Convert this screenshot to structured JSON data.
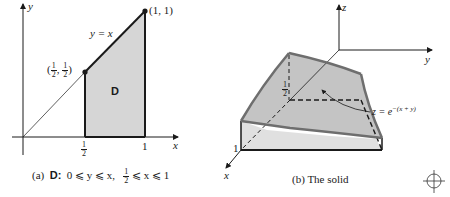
{
  "panel_a": {
    "axis_x_label": "x",
    "axis_y_label": "y",
    "line_label": "y = x",
    "point_top": "(1, 1)",
    "point_mid_open": "(",
    "point_mid_num": "1",
    "point_mid_den": "2",
    "point_mid_sep": ",",
    "point_mid_close": ")",
    "region_label": "D",
    "tick_half_num": "1",
    "tick_half_den": "2",
    "tick_one": "1",
    "caption_prefix": "(a)",
    "caption_region": "D:",
    "caption_ineq1": "0 ⩽ y ⩽ x,",
    "caption_frac_num": "1",
    "caption_frac_den": "2",
    "caption_ineq2": "⩽ x ⩽ 1"
  },
  "panel_b": {
    "axis_x_label": "x",
    "axis_y_label": "y",
    "axis_z_label": "z",
    "height_label_num": "1",
    "height_label_den": "2",
    "height_one": "1",
    "surface_label": "z = e",
    "surface_exponent": "−(x + y)",
    "caption": "(b)   The solid"
  },
  "colors": {
    "region_fill": "#d6d6d6",
    "surface_fill": "#c4c4c4",
    "side_fill": "#e0e0e0",
    "surface_edge": "#6e6e6e",
    "ink": "#1a1a1a"
  },
  "registration_mark": "crosshair-circle"
}
